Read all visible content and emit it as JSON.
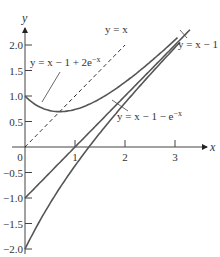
{
  "chart_data": {
    "type": "line",
    "title": "",
    "xlabel": "x",
    "ylabel": "y",
    "xlim": [
      0,
      3.6
    ],
    "ylim": [
      -2.0,
      2.2
    ],
    "grid": false,
    "x_ticks": [
      "1",
      "2",
      "3"
    ],
    "y_ticks": [
      "2.0",
      "1.5",
      "1.0",
      "0.5",
      "0",
      "-0.5",
      "-1.0",
      "-1.5",
      "-2.0"
    ],
    "origin_label": "0",
    "series": [
      {
        "name": "y = x",
        "style": "dashed",
        "x": [
          0,
          0.5,
          1,
          1.5,
          2.0
        ],
        "y": [
          0,
          0.5,
          1,
          1.5,
          2.0
        ]
      },
      {
        "name": "y = x − 1 + 2e^{−x}",
        "style": "solid",
        "x": [
          0,
          0.25,
          0.5,
          0.69,
          1,
          1.5,
          2,
          2.5,
          3
        ],
        "y": [
          1.0,
          0.81,
          0.71,
          0.69,
          0.74,
          0.95,
          1.27,
          1.66,
          2.1
        ]
      },
      {
        "name": "y = x − 1",
        "style": "solid",
        "x": [
          0,
          1,
          2,
          3,
          3.3
        ],
        "y": [
          -1,
          0,
          1,
          2,
          2.3
        ]
      },
      {
        "name": "y = x − 1 − e^{−x}",
        "style": "solid",
        "x": [
          0,
          0.25,
          0.5,
          1,
          1.28,
          1.5,
          2,
          2.5,
          3
        ],
        "y": [
          -2.0,
          -1.53,
          -1.11,
          -0.37,
          0.0,
          0.28,
          0.86,
          1.42,
          1.95
        ]
      }
    ],
    "annotations": [
      {
        "text": "y = x",
        "target": "y = x"
      },
      {
        "text": "y = x − 1 + 2e",
        "sup": "−x",
        "target": "y = x − 1 + 2e^{−x}"
      },
      {
        "text": "y = x − 1",
        "target": "y = x − 1"
      },
      {
        "text": "y = x − 1 − e",
        "sup": "−x",
        "target": "y = x − 1 − e^{−x}"
      }
    ]
  }
}
